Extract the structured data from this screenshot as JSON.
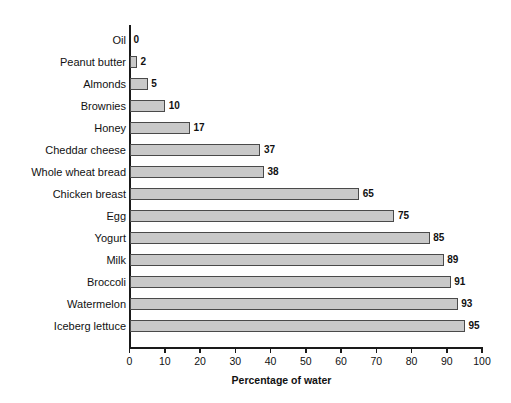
{
  "chart_data": {
    "type": "bar",
    "orientation": "horizontal",
    "title": "",
    "subtitle": "",
    "xlabel": "Percentage of water",
    "ylabel": "",
    "xlim": [
      0,
      100
    ],
    "xticks": [
      0,
      10,
      20,
      30,
      40,
      50,
      60,
      70,
      80,
      90,
      100
    ],
    "grid": false,
    "legend": null,
    "bar_fill_color": "#c9c9c9",
    "bar_edge_color": "#4a4a4a",
    "axis_color": "#1a1a1a",
    "background_color": "#ffffff",
    "show_value_labels": true,
    "categories": [
      "Oil",
      "Peanut butter",
      "Almonds",
      "Brownies",
      "Honey",
      "Cheddar cheese",
      "Whole wheat bread",
      "Chicken breast",
      "Egg",
      "Yogurt",
      "Milk",
      "Broccoli",
      "Watermelon",
      "Iceberg lettuce"
    ],
    "values": [
      0,
      2,
      5,
      10,
      17,
      37,
      38,
      65,
      75,
      85,
      89,
      91,
      93,
      95
    ],
    "value_labels": [
      "0",
      "2",
      "5",
      "10",
      "17",
      "37",
      "38",
      "65",
      "75",
      "85",
      "89",
      "91",
      "93",
      "95"
    ],
    "tick_labels": [
      "0",
      "10",
      "20",
      "30",
      "40",
      "50",
      "60",
      "70",
      "80",
      "90",
      "100"
    ]
  }
}
